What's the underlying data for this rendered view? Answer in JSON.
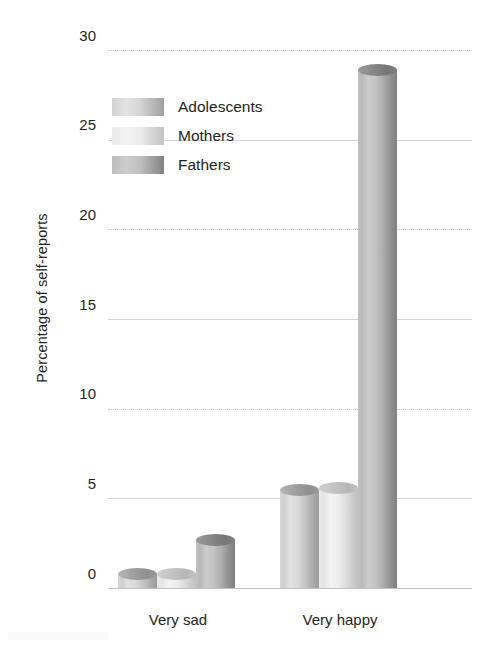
{
  "chart_data": {
    "type": "bar",
    "title": "",
    "subtitle": "",
    "xlabel": "",
    "ylabel": "Percentage of self-reports",
    "categories": [
      "Very sad",
      "Very happy"
    ],
    "series": [
      {
        "name": "Adolescents",
        "values": [
          1.1,
          5.8
        ],
        "color": "#cfcfcf"
      },
      {
        "name": "Mothers",
        "values": [
          1.1,
          5.9
        ],
        "color": "#ededed"
      },
      {
        "name": "Fathers",
        "values": [
          3.0,
          29.2
        ],
        "color": "#b4b4b4"
      }
    ],
    "ylim": [
      0,
      30
    ],
    "yticks": [
      0,
      5,
      10,
      15,
      20,
      25,
      30
    ],
    "ytick_labels": [
      "0",
      "5",
      "10",
      "15",
      "20",
      "25",
      "30"
    ],
    "grid": true,
    "grid_axis": "y",
    "legend_position": "upper-left-inside",
    "bar_style": "cylinder"
  },
  "legend": {
    "items": [
      {
        "label": "Adolescents"
      },
      {
        "label": "Mothers"
      },
      {
        "label": "Fathers"
      }
    ]
  },
  "axis": {
    "y_title": "Percentage of self-reports",
    "y_labels": {
      "t30": "30",
      "t25": "25",
      "t20": "20",
      "t15": "15",
      "t10": "10",
      "t5": "5",
      "t0": "0"
    },
    "x_labels": {
      "c0": "Very sad",
      "c1": "Very happy"
    }
  }
}
